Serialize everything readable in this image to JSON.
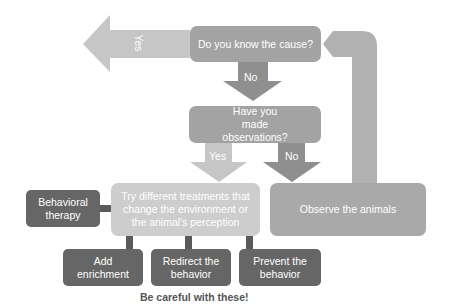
{
  "colors": {
    "background": "#ffffff",
    "question_box": "#a3a3a3",
    "yes_arrow": "#c6c6c6",
    "no_arrow": "#8f8f8f",
    "loop_arrow": "#b1b1b1",
    "treatment_box": "#cdcdcd",
    "observe_box": "#a9a9a9",
    "dark_box": "#666666",
    "connector": "#5a5a5a",
    "caution_text": "#555555"
  },
  "nodes": {
    "q1": {
      "label": "Do you know the cause?"
    },
    "q2": {
      "label": "Have you made observations?"
    },
    "treatments": {
      "label": "Try different treatments that change the environment or the animal's perception"
    },
    "behavioral_therapy": {
      "label": "Behavioral therapy"
    },
    "observe": {
      "label": "Observe the animals"
    },
    "add_enrichment": {
      "label": "Add enrichment"
    },
    "redirect": {
      "label": "Redirect the behavior"
    },
    "prevent": {
      "label": "Prevent the behavior"
    }
  },
  "edges": {
    "q1_yes": {
      "label": "Yes"
    },
    "q1_no": {
      "label": "No"
    },
    "q2_yes": {
      "label": "Yes"
    },
    "q2_no": {
      "label": "No"
    }
  },
  "caution": {
    "label": "Be careful with these!"
  }
}
